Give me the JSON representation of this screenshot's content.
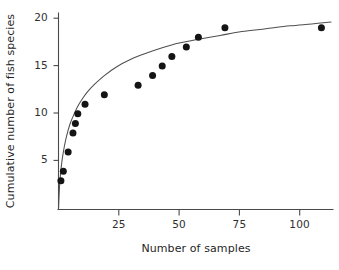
{
  "chart_data": {
    "type": "scatter",
    "title": "",
    "xlabel": "Number of samples",
    "ylabel": "Cumulative number of fish species",
    "xlim": [
      0,
      115
    ],
    "ylim": [
      0,
      20.8
    ],
    "grid": false,
    "legend": "none",
    "xticks": [
      25,
      50,
      75,
      100
    ],
    "xtick_labels": [
      "25",
      "50",
      "75",
      "100"
    ],
    "yticks": [
      5,
      10,
      15,
      20
    ],
    "ytick_labels": [
      "5",
      "10",
      "15",
      "20"
    ],
    "x": [
      1,
      2,
      4,
      6,
      7,
      8,
      11,
      19,
      33,
      39,
      43,
      47,
      53,
      58,
      69,
      109
    ],
    "y": [
      3,
      4,
      6,
      8,
      9,
      10,
      11,
      12,
      13,
      14,
      15,
      16,
      17,
      18,
      19,
      19
    ],
    "series": [
      {
        "name": "Observed cumulative species",
        "type": "scatter",
        "marker": "filled-circle",
        "color": "#141414",
        "points": [
          {
            "x": 1,
            "y": 3
          },
          {
            "x": 2,
            "y": 4
          },
          {
            "x": 4,
            "y": 6
          },
          {
            "x": 6,
            "y": 8
          },
          {
            "x": 7,
            "y": 9
          },
          {
            "x": 8,
            "y": 10
          },
          {
            "x": 11,
            "y": 11
          },
          {
            "x": 19,
            "y": 12
          },
          {
            "x": 33,
            "y": 13
          },
          {
            "x": 39,
            "y": 14
          },
          {
            "x": 43,
            "y": 15
          },
          {
            "x": 47,
            "y": 16
          },
          {
            "x": 53,
            "y": 17
          },
          {
            "x": 58,
            "y": 18
          },
          {
            "x": 69,
            "y": 19
          },
          {
            "x": 109,
            "y": 19
          }
        ]
      },
      {
        "name": "Fitted asymptotic curve",
        "type": "line",
        "color": "#4f4f4f",
        "model": "Michaelis-Menten style saturation, asymptote near 21.5",
        "points": [
          {
            "x": 0.0,
            "y": 0.0
          },
          {
            "x": 0.4,
            "y": 2.3
          },
          {
            "x": 0.8,
            "y": 3.6
          },
          {
            "x": 1.3,
            "y": 4.8
          },
          {
            "x": 2.0,
            "y": 6.0
          },
          {
            "x": 3.0,
            "y": 7.3
          },
          {
            "x": 4.0,
            "y": 8.3
          },
          {
            "x": 5.0,
            "y": 9.1
          },
          {
            "x": 6.5,
            "y": 10.0
          },
          {
            "x": 8.0,
            "y": 10.8
          },
          {
            "x": 10.0,
            "y": 11.6
          },
          {
            "x": 12.0,
            "y": 12.3
          },
          {
            "x": 15.0,
            "y": 13.1
          },
          {
            "x": 19.0,
            "y": 14.0
          },
          {
            "x": 24.0,
            "y": 14.9
          },
          {
            "x": 30.0,
            "y": 15.7
          },
          {
            "x": 36.0,
            "y": 16.3
          },
          {
            "x": 43.0,
            "y": 16.9
          },
          {
            "x": 50.0,
            "y": 17.4
          },
          {
            "x": 58.0,
            "y": 17.8
          },
          {
            "x": 67.0,
            "y": 18.2
          },
          {
            "x": 76.0,
            "y": 18.6
          },
          {
            "x": 86.0,
            "y": 18.9
          },
          {
            "x": 96.0,
            "y": 19.2
          },
          {
            "x": 105.0,
            "y": 19.4
          },
          {
            "x": 113.0,
            "y": 19.6
          }
        ]
      }
    ]
  },
  "axes": {
    "x_title": "Number of samples",
    "y_title": "Cumulative number of fish species",
    "x_tick_labels": [
      "25",
      "50",
      "75",
      "100"
    ],
    "y_tick_labels": [
      "5",
      "10",
      "15",
      "20"
    ]
  },
  "colors": {
    "marker": "#141414",
    "curve": "#4f4f4f",
    "axis": "#4a4a4a",
    "text": "#2f2f2f",
    "background": "#ffffff"
  }
}
